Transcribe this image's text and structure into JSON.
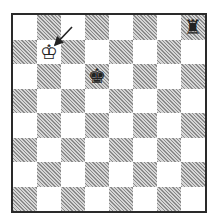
{
  "diagram": {
    "type": "chess-position",
    "orientation": "white-bottom",
    "files": [
      "a",
      "b",
      "c",
      "d",
      "e",
      "f",
      "g",
      "h"
    ],
    "ranks": [
      8,
      7,
      6,
      5,
      4,
      3,
      2,
      1
    ],
    "colors": {
      "light_square": "#ffffff",
      "dark_square": "#a8a8a8",
      "border": "#2a2a2a",
      "arrow": "#222222"
    },
    "pieces": [
      {
        "square": "b7",
        "piece": "king",
        "color": "white",
        "glyph": "♔"
      },
      {
        "square": "d6",
        "piece": "king",
        "color": "black",
        "glyph": "♚"
      },
      {
        "square": "h8",
        "piece": "rook",
        "color": "black",
        "glyph": "♜"
      }
    ],
    "arrows": [
      {
        "from_px": [
          72,
          27
        ],
        "to_px": [
          55,
          45
        ],
        "points_to": "b7"
      }
    ]
  }
}
